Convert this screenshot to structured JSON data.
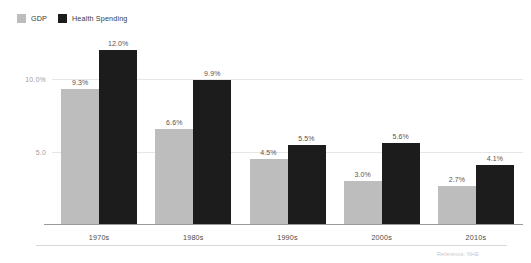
{
  "chart_data": {
    "type": "bar",
    "title": "",
    "subtitle": "",
    "xlabel": "",
    "ylabel": "",
    "categories": [
      "1970s",
      "1980s",
      "1990s",
      "2000s",
      "2010s"
    ],
    "series": [
      {
        "name": "GDP",
        "color": "#bdbdbd",
        "values": [
          9.3,
          6.6,
          4.5,
          3.0,
          2.7
        ],
        "labels": [
          "9.3%",
          "6.6%",
          "4.5%",
          "3.0%",
          "2.7%"
        ]
      },
      {
        "name": "Health Spending",
        "color": "#1c1c1c",
        "values": [
          12.0,
          9.9,
          5.5,
          5.6,
          4.1
        ],
        "labels": [
          "12.0%",
          "9.9%",
          "5.5%",
          "5.6%",
          "4.1%"
        ]
      }
    ],
    "ylim": [
      0,
      13.2
    ],
    "yticks": [
      {
        "value": 10.0,
        "label": "10.0%"
      },
      {
        "value": 5.0,
        "label": "5.0"
      }
    ],
    "grid": true,
    "legend_position": "top-left"
  },
  "legend": {
    "items": [
      {
        "label": "GDP",
        "color": "#bdbdbd"
      },
      {
        "label": "Health Spending",
        "color": "#1c1c1c"
      }
    ]
  },
  "footer": {
    "note": "Reference: NHE"
  }
}
